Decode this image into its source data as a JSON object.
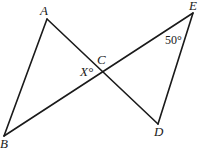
{
  "diagram": {
    "type": "geometry",
    "points": {
      "A": {
        "label": "A",
        "x": 47,
        "y": 19
      },
      "B": {
        "label": "B",
        "x": 4,
        "y": 136
      },
      "C": {
        "label": "C",
        "x": 102,
        "y": 70
      },
      "D": {
        "label": "D",
        "x": 158,
        "y": 124
      },
      "E": {
        "label": "E",
        "x": 193,
        "y": 13
      }
    },
    "segments": [
      {
        "from": "A",
        "to": "B"
      },
      {
        "from": "A",
        "to": "D"
      },
      {
        "from": "B",
        "to": "E"
      },
      {
        "from": "E",
        "to": "D"
      }
    ],
    "angles": {
      "x_label": "X°",
      "e_label": "50°"
    }
  }
}
